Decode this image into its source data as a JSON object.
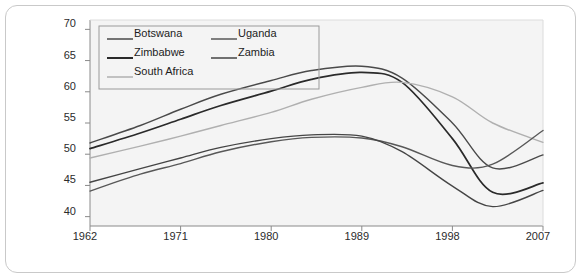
{
  "chart_data": {
    "type": "line",
    "title": "",
    "xlabel": "",
    "ylabel": "",
    "xlim": [
      1962,
      2007
    ],
    "ylim": [
      38.5,
      71.5
    ],
    "grid": false,
    "legend_position": "top-left-inside",
    "xticks": [
      "1962",
      "1971",
      "1980",
      "1989",
      "1998",
      "2007"
    ],
    "xtick_values": [
      1962,
      1971,
      1980,
      1989,
      1998,
      2007
    ],
    "yticks": [
      "40",
      "45",
      "50",
      "55",
      "60",
      "65",
      "70"
    ],
    "ytick_values": [
      40,
      45,
      50,
      55,
      60,
      65,
      70
    ],
    "x": [
      1962,
      1967,
      1971,
      1975,
      1980,
      1984,
      1989,
      1993,
      1998,
      2002,
      2007
    ],
    "series": [
      {
        "name": "Botswana",
        "color": "#4a4a4a",
        "values": [
          51.8,
          54.6,
          57.2,
          59.6,
          61.8,
          63.4,
          64.1,
          62.2,
          55.0,
          47.8,
          49.9
        ]
      },
      {
        "name": "Zimbabwe",
        "color": "#2a2a2a",
        "values": [
          50.9,
          53.4,
          55.6,
          57.8,
          60.1,
          62.0,
          63.1,
          61.5,
          52.5,
          43.9,
          45.4
        ]
      },
      {
        "name": "South Africa",
        "color": "#b0b0b0",
        "values": [
          49.4,
          51.3,
          52.9,
          54.6,
          56.7,
          58.8,
          60.7,
          61.5,
          59.2,
          55.0,
          51.9
        ]
      },
      {
        "name": "Uganda",
        "color": "#585858",
        "values": [
          44.1,
          46.8,
          48.5,
          50.4,
          52.0,
          52.7,
          52.6,
          51.2,
          48.2,
          48.4,
          53.8
        ]
      },
      {
        "name": "Zambia",
        "color": "#454545",
        "values": [
          45.5,
          47.7,
          49.4,
          51.1,
          52.5,
          53.1,
          52.9,
          50.4,
          44.9,
          41.6,
          44.2
        ]
      }
    ],
    "legend": [
      {
        "label": "Botswana",
        "color": "#4a4a4a"
      },
      {
        "label": "Zimbabwe",
        "color": "#2a2a2a"
      },
      {
        "label": "South Africa",
        "color": "#b0b0b0"
      },
      {
        "label": "Uganda",
        "color": "#585858"
      },
      {
        "label": "Zambia",
        "color": "#454545"
      }
    ]
  },
  "style": {
    "plot_background": "#f4f4f4",
    "axis_color": "#8a8a8a",
    "frame_border": "#c9c9c9",
    "legend_border": "#9a9a9a",
    "text_color": "#2b2b2b"
  }
}
